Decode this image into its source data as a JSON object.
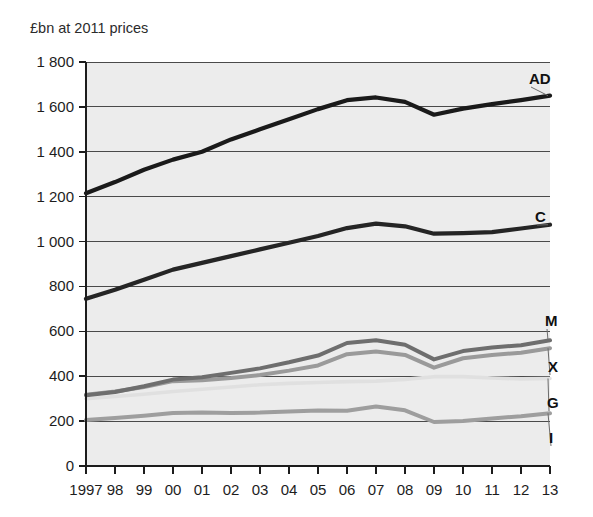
{
  "chart_data": {
    "type": "line",
    "title": "£bn at 2011 prices",
    "xlabel": "",
    "ylabel": "",
    "ylim": [
      0,
      1800
    ],
    "ytick_step": 200,
    "grid": true,
    "legend_position": "right-inline-labels",
    "ytick_labels": [
      "0",
      "200",
      "400",
      "600",
      "800",
      "1 000",
      "1 200",
      "1 400",
      "1 600",
      "1 800"
    ],
    "ytick_values": [
      0,
      200,
      400,
      600,
      800,
      1000,
      1200,
      1400,
      1600,
      1800
    ],
    "categories": [
      "1997",
      "98",
      "99",
      "00",
      "01",
      "02",
      "03",
      "04",
      "05",
      "06",
      "07",
      "08",
      "09",
      "10",
      "11",
      "12",
      "13"
    ],
    "x": [
      1997,
      1998,
      1999,
      2000,
      2001,
      2002,
      2003,
      2004,
      2005,
      2006,
      2007,
      2008,
      2009,
      2010,
      2011,
      2012,
      2013
    ],
    "series": [
      {
        "name": "AD",
        "label": "AD",
        "color": "#1a1a1a",
        "width": 4.2,
        "values": [
          1215,
          1265,
          1320,
          1365,
          1400,
          1455,
          1500,
          1545,
          1590,
          1630,
          1642,
          1622,
          1565,
          1592,
          1612,
          1630,
          1650
        ]
      },
      {
        "name": "C",
        "label": "C",
        "color": "#252525",
        "width": 4.2,
        "values": [
          745,
          785,
          830,
          875,
          905,
          935,
          965,
          995,
          1025,
          1060,
          1080,
          1068,
          1035,
          1038,
          1042,
          1058,
          1075
        ]
      },
      {
        "name": "M",
        "label": "M",
        "color": "#6e6e6e",
        "width": 4.0,
        "values": [
          315,
          330,
          355,
          385,
          395,
          415,
          435,
          462,
          492,
          548,
          560,
          540,
          475,
          512,
          528,
          538,
          560
        ]
      },
      {
        "name": "X",
        "label": "X",
        "color": "#9a9a9a",
        "width": 4.0,
        "values": [
          318,
          332,
          352,
          378,
          382,
          392,
          405,
          425,
          448,
          498,
          510,
          495,
          438,
          480,
          495,
          505,
          525
        ]
      },
      {
        "name": "G",
        "label": "G",
        "color": "#e0e0e0",
        "width": 3.6,
        "values": [
          300,
          310,
          320,
          332,
          342,
          352,
          362,
          368,
          372,
          376,
          378,
          386,
          398,
          398,
          392,
          388,
          390
        ]
      },
      {
        "name": "I",
        "label": "I",
        "color": "#9e9e9e",
        "width": 4.0,
        "values": [
          205,
          214,
          224,
          236,
          238,
          236,
          238,
          243,
          247,
          246,
          265,
          248,
          196,
          200,
          212,
          222,
          235
        ]
      }
    ],
    "series_label_positions": [
      {
        "name": "AD",
        "label_x": 529,
        "label_y": 84,
        "anchor_index": 16,
        "leader": true
      },
      {
        "name": "C",
        "label_x": 535,
        "label_y": 222,
        "anchor_index": 16,
        "leader": true
      },
      {
        "name": "M",
        "label_x": 545,
        "label_y": 326,
        "anchor_index": 16,
        "leader": true
      },
      {
        "name": "X",
        "label_x": 548,
        "label_y": 372,
        "anchor_index": 16,
        "leader": true
      },
      {
        "name": "G",
        "label_x": 547,
        "label_y": 408,
        "anchor_index": 16,
        "leader": true
      },
      {
        "name": "I",
        "label_x": 549,
        "label_y": 443,
        "anchor_index": 16,
        "leader": true
      }
    ]
  }
}
